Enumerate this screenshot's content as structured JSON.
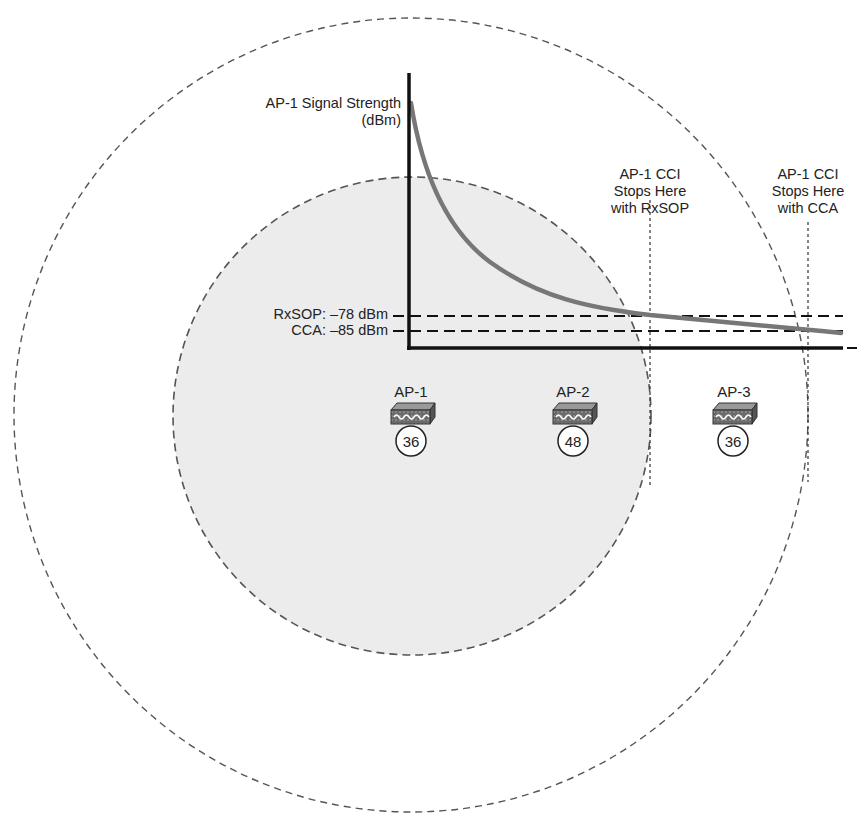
{
  "diagram": {
    "y_axis_label_line1": "AP-1 Signal Strength",
    "y_axis_label_line2": "(dBm)",
    "thresholds": [
      {
        "name": "RxSOP",
        "label": "RxSOP: –78 dBm",
        "dbm": -78
      },
      {
        "name": "CCA",
        "label": "CCA: –85 dBm",
        "dbm": -85
      }
    ],
    "annotations": {
      "rxsop_stop": {
        "line1": "AP-1 CCI",
        "line2": "Stops Here",
        "line3": "with RxSOP"
      },
      "cca_stop": {
        "line1": "AP-1 CCI",
        "line2": "Stops Here",
        "line3": "with CCA"
      }
    },
    "access_points": [
      {
        "name": "AP-1",
        "channel": "36"
      },
      {
        "name": "AP-2",
        "channel": "48"
      },
      {
        "name": "AP-3",
        "channel": "36"
      }
    ],
    "colors": {
      "inner_cell_fill": "#ececec",
      "circle_stroke": "#555555",
      "curve": "#777777",
      "axis": "#111111"
    }
  }
}
